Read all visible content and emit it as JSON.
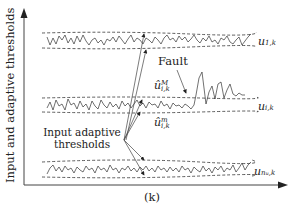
{
  "axes": {
    "y_label": "Input and adaptive thresholds",
    "x_label": "(k)"
  },
  "signals": [
    {
      "name": "u_{1,k}",
      "base": "u",
      "subscript": "1,k"
    },
    {
      "name": "u_{i,k}",
      "base": "u",
      "subscript": "i,k"
    },
    {
      "name": "u_{n_u,k}",
      "base": "u",
      "subscript": "n",
      "subsub": "u",
      "subscript_tail": ",k"
    }
  ],
  "annotations": {
    "fault": "Fault",
    "upper_threshold": {
      "base": "û",
      "superscript": "M",
      "subscript": "i,k"
    },
    "lower_threshold": {
      "base": "û",
      "superscript": "m",
      "subscript": "i,k"
    },
    "threshold_callout_line1": "Input adaptive",
    "threshold_callout_line2": "thresholds"
  },
  "colors": {
    "line": "#333333",
    "dashed": "#333333",
    "background": "#ffffff"
  }
}
